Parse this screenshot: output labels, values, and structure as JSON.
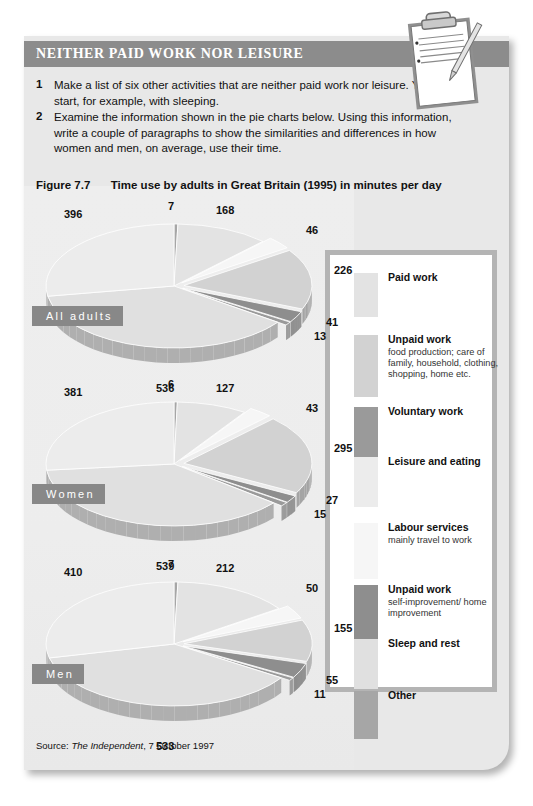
{
  "panel": {
    "title": "NEITHER PAID WORK NOR LEISURE",
    "tasks": [
      {
        "num": "1",
        "text": "Make a list of six other activities that are neither paid work nor leisure. You could start, for example, with sleeping."
      },
      {
        "num": "2",
        "text": "Examine the information shown in the pie charts below. Using this information, write a couple of paragraphs to show the similarities and differences in how women and men, on average, use their time."
      }
    ],
    "figure_number": "Figure 7.7",
    "figure_title": "Time use by adults in Great Britain (1995) in minutes per day",
    "source_prefix": "Source:",
    "source_publication": "The Independent",
    "source_date": ", 7 October 1997"
  },
  "icons": {
    "clipboard": "clipboard-with-pencil-icon"
  },
  "colors": {
    "panel_bg": "#e8e8e8",
    "title_band": "#8c8c8c",
    "legend_border": "#b4b4b4",
    "tag_bg": "#888888",
    "paid_work": "#e3e3e3",
    "unpaid_work_food": "#d2d2d2",
    "voluntary_work": "#9a9a9a",
    "leisure_eating": "#ececec",
    "labour_services": "#f6f6f6",
    "unpaid_work_self": "#8e8e8e",
    "sleep_rest": "#e0e0e0",
    "other": "#a6a6a6"
  },
  "legend": {
    "items": [
      {
        "title": "Paid work",
        "sub": "",
        "color": "#e3e3e3"
      },
      {
        "title": "Unpaid work",
        "sub": "food production; care of family, household, clothing, shopping, home etc.",
        "color": "#d2d2d2"
      },
      {
        "title": "Voluntary work",
        "sub": "",
        "color": "#9a9a9a"
      },
      {
        "title": "Leisure and eating",
        "sub": "",
        "color": "#ececec"
      },
      {
        "title": "Labour services",
        "sub": "mainly travel to work",
        "color": "#f6f6f6"
      },
      {
        "title": "Unpaid work",
        "sub": "self-improvement/ home improvement",
        "color": "#8e8e8e"
      },
      {
        "title": "Sleep and rest",
        "sub": "",
        "color": "#e0e0e0"
      },
      {
        "title": "Other",
        "sub": "",
        "color": "#a6a6a6"
      }
    ]
  },
  "chart_data": {
    "type": "pie",
    "title": "Time use by adults in Great Britain (1995) in minutes per day",
    "unit": "minutes per day",
    "categories": [
      "Paid work",
      "Unpaid work (food production; care of family, household, clothing, shopping, home etc.)",
      "Voluntary work",
      "Leisure and eating",
      "Labour services (mainly travel to work)",
      "Unpaid work (self-improvement/home improvement)",
      "Sleep and rest",
      "Other"
    ],
    "legend_position": "right",
    "series": [
      {
        "name": "All adults",
        "values": [
          168,
          46,
          226,
          41,
          13,
          536,
          396,
          7
        ]
      },
      {
        "name": "Women",
        "values": [
          127,
          43,
          295,
          27,
          15,
          539,
          381,
          6
        ]
      },
      {
        "name": "Men",
        "values": [
          212,
          50,
          155,
          55,
          11,
          533,
          410,
          7
        ]
      }
    ],
    "pies": [
      {
        "group": "All adults",
        "slices": [
          {
            "label": "7",
            "value": 7,
            "category": "Other"
          },
          {
            "label": "168",
            "value": 168,
            "category": "Paid work"
          },
          {
            "label": "46",
            "value": 46,
            "category": "Labour services"
          },
          {
            "label": "226",
            "value": 226,
            "category": "Unpaid work food"
          },
          {
            "label": "41",
            "value": 41,
            "category": "Unpaid work self"
          },
          {
            "label": "13",
            "value": 13,
            "category": "Voluntary work"
          },
          {
            "label": "536",
            "value": 536,
            "category": "Sleep and rest"
          },
          {
            "label": "396",
            "value": 396,
            "category": "Leisure and eating"
          }
        ]
      },
      {
        "group": "Women",
        "slices": [
          {
            "label": "6",
            "value": 6,
            "category": "Other"
          },
          {
            "label": "127",
            "value": 127,
            "category": "Paid work"
          },
          {
            "label": "43",
            "value": 43,
            "category": "Labour services"
          },
          {
            "label": "295",
            "value": 295,
            "category": "Unpaid work food"
          },
          {
            "label": "27",
            "value": 27,
            "category": "Unpaid work self"
          },
          {
            "label": "15",
            "value": 15,
            "category": "Voluntary work"
          },
          {
            "label": "539",
            "value": 539,
            "category": "Sleep and rest"
          },
          {
            "label": "381",
            "value": 381,
            "category": "Leisure and eating"
          }
        ]
      },
      {
        "group": "Men",
        "slices": [
          {
            "label": "7",
            "value": 7,
            "category": "Other"
          },
          {
            "label": "212",
            "value": 212,
            "category": "Paid work"
          },
          {
            "label": "50",
            "value": 50,
            "category": "Labour services"
          },
          {
            "label": "155",
            "value": 155,
            "category": "Unpaid work food"
          },
          {
            "label": "55",
            "value": 55,
            "category": "Unpaid work self"
          },
          {
            "label": "11",
            "value": 11,
            "category": "Voluntary work"
          },
          {
            "label": "533",
            "value": 533,
            "category": "Sleep and rest"
          },
          {
            "label": "410",
            "value": 410,
            "category": "Leisure and eating"
          }
        ]
      }
    ]
  }
}
